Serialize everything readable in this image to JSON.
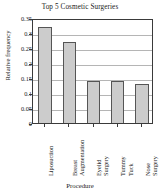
{
  "chart_data": {
    "type": "bar",
    "title": "Top 5 Cosmetic Surgeries",
    "xlabel": "Procedure",
    "ylabel": "Relative frequency",
    "categories": [
      "Liposuction",
      "Breast Augmentation",
      "Eyelid Surgery",
      "Tummy Tuck",
      "Nose Surgery"
    ],
    "values": [
      0.32,
      0.27,
      0.14,
      0.14,
      0.13
    ],
    "ylim": [
      0,
      0.35
    ],
    "yticks": [
      0,
      0.05,
      0.1,
      0.15,
      0.2,
      0.25,
      0.3,
      0.35
    ],
    "ytick_labels": [
      "0",
      "0.05",
      "0.1",
      "0.15",
      "0.2",
      "0.25",
      "0.3",
      "0.35"
    ],
    "grid": true,
    "legend": false,
    "bar_color": "#cccccc",
    "bar_edge_color": "#555555",
    "axis_color": "#3a3a3a",
    "grid_color": "#b5b5b5"
  }
}
